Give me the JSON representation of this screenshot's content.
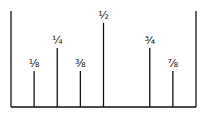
{
  "diagram": {
    "type": "ruler-fractions",
    "ruler": {
      "left_x": 11,
      "right_x": 196,
      "baseline_y": 107,
      "wall_top_y": 11
    },
    "ticks": [
      {
        "label": "⅛",
        "fraction": 0.125,
        "top_y": 71
      },
      {
        "label": "¼",
        "fraction": 0.25,
        "top_y": 48
      },
      {
        "label": "⅜",
        "fraction": 0.375,
        "top_y": 71
      },
      {
        "label": "½",
        "fraction": 0.5,
        "top_y": 23
      },
      {
        "label": "¾",
        "fraction": 0.75,
        "top_y": 48
      },
      {
        "label": "⅞",
        "fraction": 0.875,
        "top_y": 71
      }
    ],
    "line_color": "#111111"
  }
}
